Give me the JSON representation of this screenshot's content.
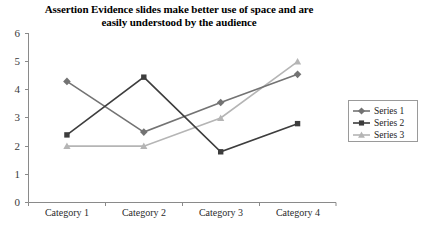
{
  "chart_data": {
    "type": "line",
    "title": "Assertion Evidence slides make better use of space and are easily understood by the audience",
    "title_line1": "Assertion Evidence slides make better use of space and are",
    "title_line2": "easily understood by the audience",
    "xlabel": "",
    "ylabel": "",
    "categories": [
      "Category 1",
      "Category 2",
      "Category 3",
      "Category 4"
    ],
    "ylim": [
      0,
      6
    ],
    "ytick_labels": [
      "0",
      "1",
      "2",
      "3",
      "4",
      "5",
      "6"
    ],
    "ytick_values": [
      0,
      1,
      2,
      3,
      4,
      5,
      6
    ],
    "grid": false,
    "legend_position": "right",
    "series": [
      {
        "name": "Series 1",
        "values": [
          4.3,
          2.5,
          3.55,
          4.55
        ],
        "marker": "diamond",
        "color": "#737373"
      },
      {
        "name": "Series 2",
        "values": [
          2.4,
          4.45,
          1.8,
          2.8
        ],
        "marker": "square",
        "color": "#3d3d3d"
      },
      {
        "name": "Series 3",
        "values": [
          2.0,
          2.0,
          3.0,
          5.0
        ],
        "marker": "triangle",
        "color": "#b5b5b5"
      }
    ]
  },
  "legend": {
    "items": [
      {
        "label": "Series 1"
      },
      {
        "label": "Series 2"
      },
      {
        "label": "Series 3"
      }
    ]
  },
  "axes": {
    "y_labels": [
      "6",
      "5",
      "4",
      "3",
      "2",
      "1",
      "0"
    ],
    "x_labels": [
      "Category 1",
      "Category 2",
      "Category 3",
      "Category 4"
    ]
  }
}
